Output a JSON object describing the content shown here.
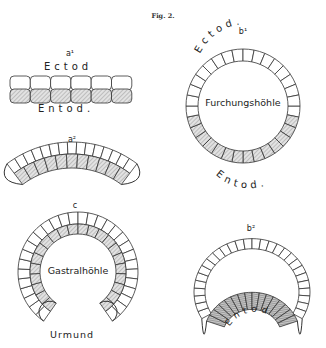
{
  "figure": {
    "title": "Fig. 2."
  },
  "panels": {
    "a1": {
      "label": "a¹",
      "top_layer": "Ectod",
      "bottom_layer": "Entod."
    },
    "a2": {
      "label": "a²"
    },
    "b1": {
      "label": "b¹",
      "top_layer": "Ectod.",
      "cavity": "Furchungshöhle",
      "bottom_layer": "Entod."
    },
    "c": {
      "label": "c",
      "cavity": "Gastralhöhle",
      "opening": "Urmund"
    },
    "b2": {
      "label": "b²",
      "inner_layer": "Entod."
    }
  },
  "colors": {
    "line": "#333333",
    "background": "#ffffff"
  }
}
